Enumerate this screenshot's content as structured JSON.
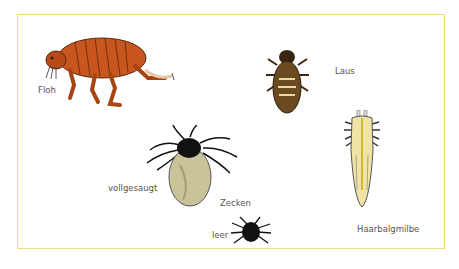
{
  "figure": {
    "border_color": "#f2dc7a",
    "labels": {
      "flea": "Floh",
      "louse": "Laus",
      "tick_engorged": "vollgesaugt",
      "ticks": "Zecken",
      "tick_empty": "leer",
      "follicle_mite": "Haarbalgmilbe"
    },
    "colors": {
      "flea": "#c8561e",
      "louse": "#5a3d1c",
      "tick": "#111111",
      "tick_engorged_body": "#c9c39a",
      "mite": "#efe4a6"
    }
  }
}
